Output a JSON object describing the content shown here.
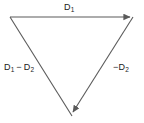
{
  "figure": {
    "type": "vector-triangle-diagram",
    "background_color": "#ffffff",
    "stroke_color": "#5a5a5a",
    "text_color": "#1a1a1a",
    "vertices": {
      "top_left": [
        10,
        17
      ],
      "top_right": [
        133,
        17
      ],
      "bottom_apex": [
        72,
        116
      ]
    },
    "edges": [
      {
        "name": "top-edge",
        "from": "top_left",
        "to": "top_right",
        "arrowhead_at": "top_right",
        "label": "D1"
      },
      {
        "name": "left-edge",
        "from": "top_left",
        "to": "bottom_apex",
        "arrowhead_at": "none",
        "label": "D1 - D2"
      },
      {
        "name": "right-edge",
        "from": "top_right",
        "to": "bottom_apex",
        "arrowhead_at": "bottom_apex",
        "label": "-D2"
      }
    ],
    "labels": {
      "top": {
        "symbol": "D",
        "subscript": "1",
        "full": "D1"
      },
      "left": {
        "first_symbol": "D",
        "first_subscript": "1",
        "operator": "−",
        "second_symbol": "D",
        "second_subscript": "2",
        "full": "D1 − D2"
      },
      "right": {
        "operator": "−",
        "symbol": "D",
        "subscript": "2",
        "full": "−D2"
      }
    }
  }
}
